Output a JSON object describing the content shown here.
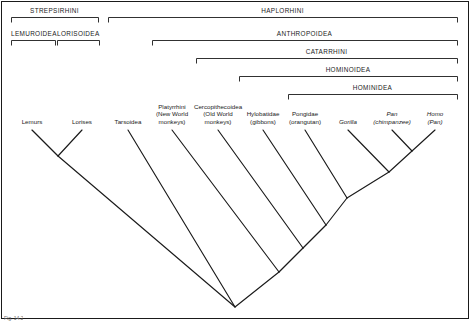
{
  "figure": {
    "line_color": "#1a1a1a",
    "background_color": "#ffffff",
    "footer_note": "Fig. 14.2"
  },
  "ranks": [
    {
      "name": "STREPSIRHINI",
      "label": "STREPSIRHINI",
      "x1": 11,
      "x2": 98,
      "y": 17,
      "text_y": 7
    },
    {
      "name": "HAPLORHINI",
      "label": "HAPLORHINI",
      "x1": 108,
      "x2": 457,
      "y": 17,
      "text_y": 7
    },
    {
      "name": "LEMUROIDEA",
      "label": "LEMUROIDEA",
      "x1": 11,
      "x2": 55,
      "y": 40,
      "text_y": 30
    },
    {
      "name": "LORISOIDEA",
      "label": "LORISOIDEA",
      "x1": 57,
      "x2": 99,
      "y": 40,
      "text_y": 30
    },
    {
      "name": "ANTHROPOIDEA",
      "label": "ANTHROPOIDEA",
      "x1": 152,
      "x2": 457,
      "y": 40,
      "text_y": 30
    },
    {
      "name": "CATARRHINI",
      "label": "CATARRHINI",
      "x1": 196,
      "x2": 457,
      "y": 58,
      "text_y": 48
    },
    {
      "name": "HOMINOIDEA",
      "label": "HOMINOIDEA",
      "x1": 239,
      "x2": 457,
      "y": 76,
      "text_y": 66
    },
    {
      "name": "HOMINIDEA",
      "label": "HOMINIDEA",
      "x1": 288,
      "x2": 457,
      "y": 94,
      "text_y": 84
    }
  ],
  "tips": [
    {
      "name": "lemurs",
      "lines": [
        "Lemurs"
      ],
      "x": 32,
      "italic": false
    },
    {
      "name": "lorises",
      "lines": [
        "Lorises"
      ],
      "x": 82,
      "italic": false
    },
    {
      "name": "tarsoidea",
      "lines": [
        "Tarsoidea"
      ],
      "x": 128,
      "italic": false
    },
    {
      "name": "platyrrhini",
      "lines": [
        "Platyrrhini",
        "(New World",
        "monkeys)"
      ],
      "x": 172,
      "italic": false
    },
    {
      "name": "cercopithecoidea",
      "lines": [
        "Cercopithecoidea",
        "(Old World",
        "monkeys)"
      ],
      "x": 218,
      "italic": false
    },
    {
      "name": "hylobatidae",
      "lines": [
        "Hylobatidae",
        "(gibbons)"
      ],
      "x": 263,
      "italic": false
    },
    {
      "name": "pongidae",
      "lines": [
        "Pongidae",
        "(orangutan)"
      ],
      "x": 305,
      "italic": false
    },
    {
      "name": "gorilla",
      "lines": [
        "Gorilla"
      ],
      "x": 348,
      "italic": true
    },
    {
      "name": "pan",
      "lines": [
        "Pan",
        "(chimpanzee)"
      ],
      "x": 392,
      "italic": true
    },
    {
      "name": "homo",
      "lines": [
        "Homo",
        "(Pan)"
      ],
      "x": 435,
      "italic": true
    }
  ],
  "tree": {
    "tip_y": 130,
    "root": {
      "x": 235,
      "y": 307
    },
    "branches": [
      {
        "name": "branch-lemurs",
        "x1": 32,
        "y1": 130,
        "x2": 58,
        "y2": 156
      },
      {
        "name": "branch-lorises",
        "x1": 82,
        "y1": 130,
        "x2": 58,
        "y2": 156
      },
      {
        "name": "branch-strepsirhini-stem",
        "x1": 58,
        "y1": 156,
        "x2": 235,
        "y2": 307
      },
      {
        "name": "branch-tarsoidea",
        "x1": 128,
        "y1": 130,
        "x2": 235,
        "y2": 307
      },
      {
        "name": "branch-platyrrhini",
        "x1": 172,
        "y1": 130,
        "x2": 279,
        "y2": 272
      },
      {
        "name": "branch-cercopithecoidea",
        "x1": 218,
        "y1": 130,
        "x2": 303,
        "y2": 248
      },
      {
        "name": "branch-hylobatidae",
        "x1": 263,
        "y1": 130,
        "x2": 326,
        "y2": 225
      },
      {
        "name": "branch-pongidae",
        "x1": 305,
        "y1": 130,
        "x2": 347,
        "y2": 198
      },
      {
        "name": "branch-gorilla",
        "x1": 348,
        "y1": 130,
        "x2": 389,
        "y2": 172
      },
      {
        "name": "branch-pan",
        "x1": 392,
        "y1": 130,
        "x2": 412,
        "y2": 151
      },
      {
        "name": "branch-homo",
        "x1": 435,
        "y1": 130,
        "x2": 412,
        "y2": 151
      },
      {
        "name": "branch-panhomo-stem",
        "x1": 412,
        "y1": 151,
        "x2": 389,
        "y2": 172
      },
      {
        "name": "branch-gorilla-clade",
        "x1": 389,
        "y1": 172,
        "x2": 347,
        "y2": 198
      },
      {
        "name": "branch-pongidae-clade",
        "x1": 347,
        "y1": 198,
        "x2": 326,
        "y2": 225
      },
      {
        "name": "branch-hominoidea-stem",
        "x1": 326,
        "y1": 225,
        "x2": 303,
        "y2": 248
      },
      {
        "name": "branch-catarrhini-stem",
        "x1": 303,
        "y1": 248,
        "x2": 279,
        "y2": 272
      },
      {
        "name": "branch-anthropoidea-stem",
        "x1": 279,
        "y1": 272,
        "x2": 235,
        "y2": 307
      }
    ]
  }
}
